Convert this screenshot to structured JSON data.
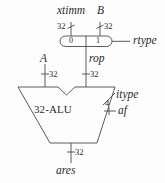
{
  "diagram": {
    "stroke_color": "#4a4a4a",
    "text_color": "#2b2b2b",
    "background_color": "#fdfdfd"
  },
  "inputs": {
    "ximm": {
      "label": "xtimm",
      "width": "32"
    },
    "b": {
      "label": "B",
      "width": "32"
    },
    "a": {
      "label": "A",
      "width": "32"
    }
  },
  "mux": {
    "port0": "0",
    "port1": "1",
    "select_label": "rtype",
    "output_label": "rop",
    "output_width": "32"
  },
  "alu": {
    "label": "32-ALU",
    "control": {
      "itype_label": "itype",
      "af_label": "af",
      "af_width": "4"
    }
  },
  "output": {
    "label": "ares",
    "width": "32"
  }
}
